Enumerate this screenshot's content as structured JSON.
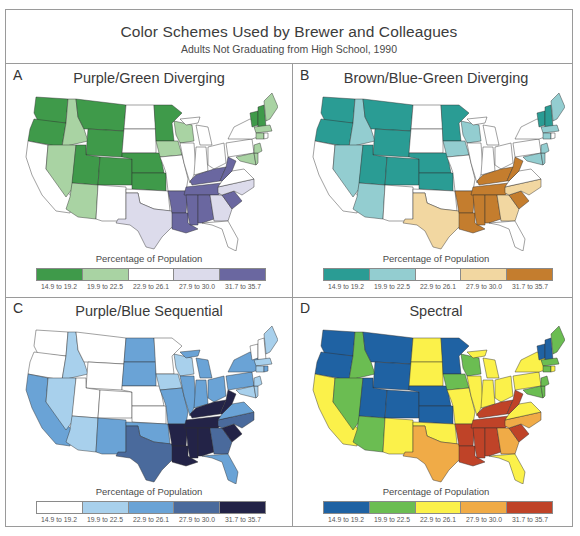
{
  "header": {
    "title": "Color Schemes Used by Brewer and Colleagues",
    "subtitle": "Adults Not Graduating from High School, 1990"
  },
  "legend_title": "Percentage of Population",
  "chart_data": {
    "type": "choropleth",
    "title": "Color Schemes Used by Brewer and Colleagues",
    "subtitle": "Adults Not Graduating from High School, 1990",
    "legend_title": "Percentage of Population",
    "classes": [
      "14.9 to 19.2",
      "19.9 to 22.5",
      "22.9 to 26.1",
      "27.9 to 30.0",
      "31.7 to 35.7"
    ],
    "state_class": {
      "WA": 1,
      "OR": 1,
      "MT": 1,
      "WY": 1,
      "UT": 1,
      "CO": 1,
      "NE": 1,
      "KS": 1,
      "MN": 1,
      "VT": 1,
      "NH": 1,
      "ID": 2,
      "NV": 2,
      "AZ": 2,
      "WI": 2,
      "IA": 2,
      "ME": 2,
      "MA": 2,
      "CT": 2,
      "MD": 2,
      "DE": 2,
      "NJ": 2,
      "CA": 3,
      "NM": 3,
      "ND": 3,
      "SD": 3,
      "OK": 3,
      "MO": 3,
      "IL": 3,
      "IN": 3,
      "OH": 3,
      "MI": 3,
      "PA": 3,
      "NY": 3,
      "VA": 3,
      "FL": 3,
      "RI": 3,
      "TX": 4,
      "GA": 4,
      "NC": 4,
      "AR": 5,
      "LA": 5,
      "MS": 5,
      "AL": 5,
      "TN": 5,
      "KY": 5,
      "WV": 5,
      "SC": 5
    },
    "panels": [
      {
        "letter": "A",
        "title": "Purple/Green Diverging",
        "colors": [
          "#3f9a4a",
          "#a9d3a3",
          "#ffffff",
          "#dcdbeb",
          "#6a67a0"
        ]
      },
      {
        "letter": "B",
        "title": "Brown/Blue-Green Diverging",
        "colors": [
          "#2a9c94",
          "#93cdd0",
          "#ffffff",
          "#f2d7a1",
          "#c47d2e"
        ]
      },
      {
        "letter": "C",
        "title": "Purple/Blue Sequential",
        "colors": [
          "#ffffff",
          "#a8d0ec",
          "#6aa3d6",
          "#4a6a9c",
          "#232347"
        ]
      },
      {
        "letter": "D",
        "title": "Spectral",
        "colors": [
          "#1f62a3",
          "#6bbd52",
          "#fbf14a",
          "#f0ab47",
          "#bf4328"
        ]
      }
    ]
  }
}
